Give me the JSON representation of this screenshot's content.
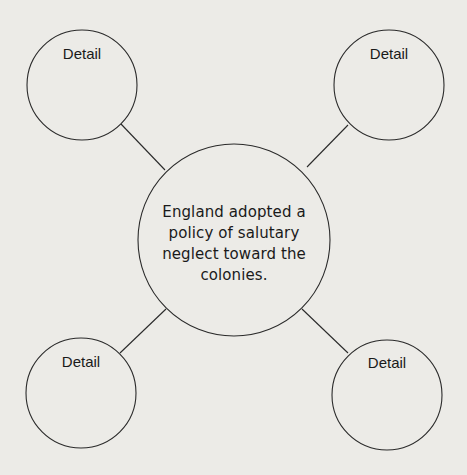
{
  "diagram": {
    "type": "web-organizer",
    "background_color": "#ecebe7",
    "line_color": "#2a2a2a",
    "main_idea": {
      "lines": [
        "England adopted a",
        "policy of salutary",
        "neglect toward the",
        "colonies."
      ]
    },
    "details": [
      {
        "position": "top-left",
        "label": "Detail"
      },
      {
        "position": "top-right",
        "label": "Detail"
      },
      {
        "position": "bottom-left",
        "label": "Detail"
      },
      {
        "position": "bottom-right",
        "label": "Detail"
      }
    ]
  }
}
